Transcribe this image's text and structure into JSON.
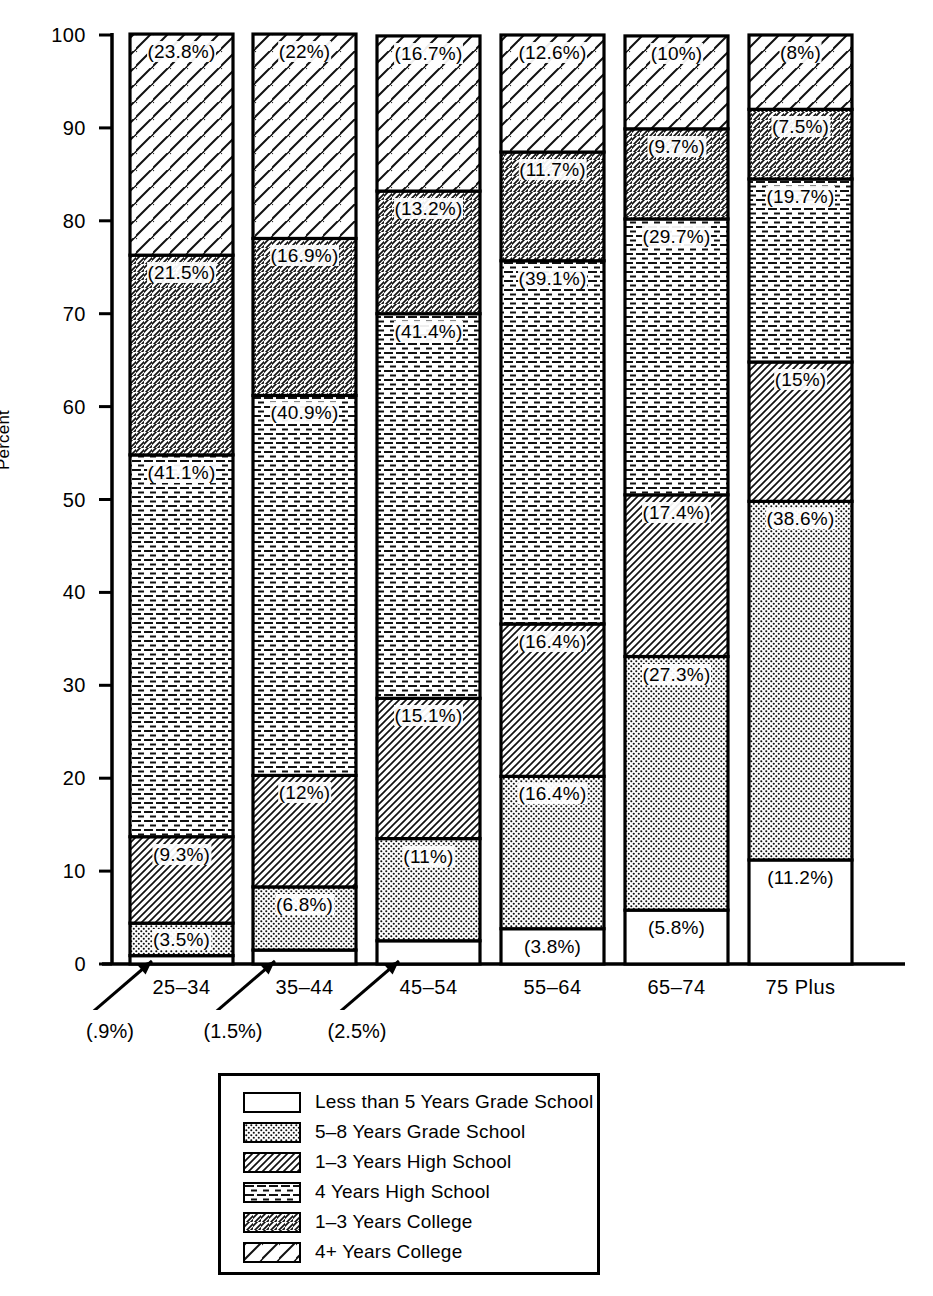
{
  "axis": {
    "ylabel": "Percent",
    "ytick_labels": [
      "0",
      "10",
      "20",
      "30",
      "40",
      "50",
      "60",
      "70",
      "80",
      "90",
      "100"
    ]
  },
  "categories": [
    "25–34",
    "35–44",
    "45–54",
    "55–64",
    "65–74",
    "75 Plus"
  ],
  "annotations": [
    {
      "text": "(.9%)",
      "category": "25–34"
    },
    {
      "text": "(1.5%)",
      "category": "35–44"
    },
    {
      "text": "(2.5%)",
      "category": "45–54"
    }
  ],
  "legend": {
    "items": [
      {
        "label": "Less than 5 Years Grade School",
        "pattern": "blank"
      },
      {
        "label": "5–8 Years Grade School",
        "pattern": "dots"
      },
      {
        "label": "1–3 Years High School",
        "pattern": "hatch-back-dense"
      },
      {
        "label": "4 Years High School",
        "pattern": "horizontal"
      },
      {
        "label": "1–3 Years College",
        "pattern": "hatch-fwd"
      },
      {
        "label": "4+ Years College",
        "pattern": "hatch-back-sparse"
      }
    ]
  },
  "chart_data": {
    "type": "bar",
    "subtype": "stacked-100",
    "title": "",
    "xlabel": "",
    "ylabel": "Percent",
    "ylim": [
      0,
      100
    ],
    "yticks": [
      0,
      10,
      20,
      30,
      40,
      50,
      60,
      70,
      80,
      90,
      100
    ],
    "grid": false,
    "legend_position": "below-plot",
    "categories": [
      "25–34",
      "35–44",
      "45–54",
      "55–64",
      "65–74",
      "75 Plus"
    ],
    "series": [
      {
        "name": "Less than 5 Years Grade School",
        "pattern": "blank",
        "values": [
          0.9,
          1.5,
          2.5,
          3.8,
          5.8,
          11.2
        ],
        "labels": [
          "(.9%)",
          "(1.5%)",
          "(2.5%)",
          "(3.8%)",
          "(5.8%)",
          "(11.2%)"
        ],
        "labels_outside": [
          true,
          true,
          true,
          false,
          false,
          false
        ]
      },
      {
        "name": "5–8 Years Grade School",
        "pattern": "dots",
        "values": [
          3.5,
          6.8,
          11,
          16.4,
          27.3,
          38.6
        ],
        "labels": [
          "(3.5%)",
          "(6.8%)",
          "(11%)",
          "(16.4%)",
          "(27.3%)",
          "(38.6%)"
        ],
        "labels_outside": [
          false,
          false,
          false,
          false,
          false,
          false
        ]
      },
      {
        "name": "1–3 Years High School",
        "pattern": "hatch-back-dense",
        "values": [
          9.3,
          12,
          15.1,
          16.4,
          17.4,
          15
        ],
        "labels": [
          "(9.3%)",
          "(12%)",
          "(15.1%)",
          "(16.4%)",
          "(17.4%)",
          "(15%)"
        ],
        "labels_outside": [
          false,
          false,
          false,
          false,
          false,
          false
        ]
      },
      {
        "name": "4 Years High School",
        "pattern": "horizontal",
        "values": [
          41.1,
          40.9,
          41.4,
          39.1,
          29.7,
          19.7
        ],
        "labels": [
          "(41.1%)",
          "(40.9%)",
          "(41.4%)",
          "(39.1%)",
          "(29.7%)",
          "(19.7%)"
        ],
        "labels_outside": [
          false,
          false,
          false,
          false,
          false,
          false
        ]
      },
      {
        "name": "1–3 Years College",
        "pattern": "hatch-fwd",
        "values": [
          21.5,
          16.9,
          13.2,
          11.7,
          9.7,
          7.5
        ],
        "labels": [
          "(21.5%)",
          "(16.9%)",
          "(13.2%)",
          "(11.7%)",
          "(9.7%)",
          "(7.5%)"
        ],
        "labels_outside": [
          false,
          false,
          false,
          false,
          false,
          false
        ]
      },
      {
        "name": "4+ Years College",
        "pattern": "hatch-back-sparse",
        "values": [
          23.8,
          22,
          16.7,
          12.6,
          10,
          8
        ],
        "labels": [
          "(23.8%)",
          "(22%)",
          "(16.7%)",
          "(12.6%)",
          "(10%)",
          "(8%)"
        ],
        "labels_outside": [
          false,
          false,
          false,
          false,
          false,
          false
        ]
      }
    ]
  }
}
